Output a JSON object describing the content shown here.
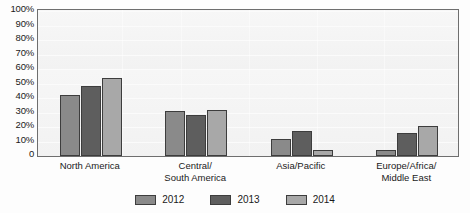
{
  "chart_data": {
    "type": "bar",
    "title": "",
    "xlabel": "",
    "ylabel": "",
    "ylim": [
      0,
      100
    ],
    "grid": true,
    "legend_position": "bottom",
    "categories": [
      "North America",
      "Central/ South America",
      "Asia/Pacific",
      "Europe/Africa/ Middle East"
    ],
    "series": [
      {
        "name": "2012",
        "color": "#8a8a8a",
        "values": [
          42,
          31,
          12,
          4
        ]
      },
      {
        "name": "2013",
        "color": "#5e5e5e",
        "values": [
          48,
          28,
          17,
          16
        ]
      },
      {
        "name": "2014",
        "color": "#a8a8a8",
        "values": [
          54,
          32,
          4,
          21
        ]
      }
    ],
    "ytick_labels": [
      "100%",
      "90%",
      "80%",
      "70%",
      "60%",
      "50%",
      "40%",
      "30%",
      "20%",
      "10%",
      "0"
    ],
    "ytick_values": [
      100,
      90,
      80,
      70,
      60,
      50,
      40,
      30,
      20,
      10,
      0
    ]
  },
  "axis": {
    "y": {
      "ticks": [
        {
          "label": "100%",
          "value": 100
        },
        {
          "label": "90%",
          "value": 90
        },
        {
          "label": "80%",
          "value": 80
        },
        {
          "label": "70%",
          "value": 70
        },
        {
          "label": "60%",
          "value": 60
        },
        {
          "label": "50%",
          "value": 50
        },
        {
          "label": "40%",
          "value": 40
        },
        {
          "label": "30%",
          "value": 30
        },
        {
          "label": "20%",
          "value": 20
        },
        {
          "label": "10%",
          "value": 10
        },
        {
          "label": "0",
          "value": 0
        }
      ]
    }
  },
  "categories": [
    {
      "lines": [
        "North America"
      ]
    },
    {
      "lines": [
        "Central/",
        "South America"
      ]
    },
    {
      "lines": [
        "Asia/Pacific"
      ]
    },
    {
      "lines": [
        "Europe/Africa/",
        "Middle East"
      ]
    }
  ],
  "legend": {
    "items": [
      {
        "label": "2012",
        "color": "#8a8a8a"
      },
      {
        "label": "2013",
        "color": "#5e5e5e"
      },
      {
        "label": "2014",
        "color": "#a8a8a8"
      }
    ]
  },
  "colors": {
    "series_2012": "#8a8a8a",
    "series_2013": "#5e5e5e",
    "series_2014": "#a8a8a8",
    "plot_background": "#f4f4f4",
    "plot_border": "#6e6e6e",
    "bar_outline": "#3d3d3d",
    "text": "#1a1a1a"
  }
}
